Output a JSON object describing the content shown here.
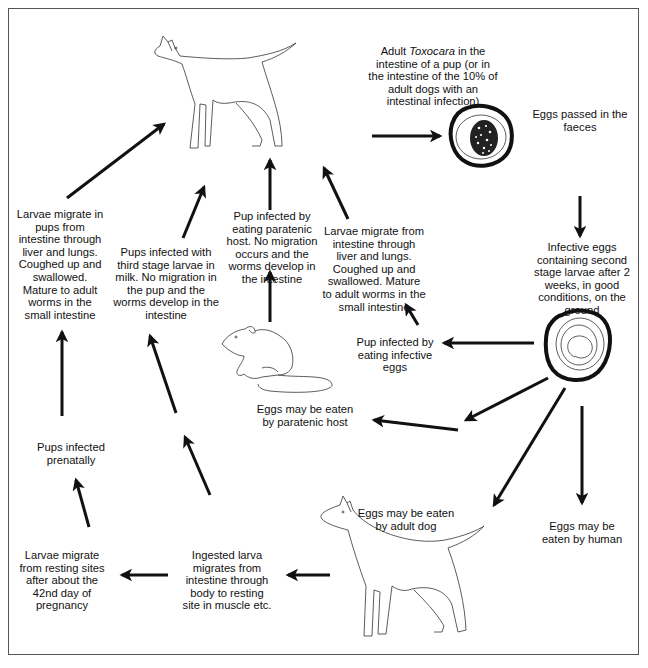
{
  "diagram": {
    "labels": {
      "adult_toxocara": {
        "pre": "Adult ",
        "italic": "Toxocara",
        "post": " in the intestine of a pup (or in the intestine of the 10% of adult dogs with an intestinal infection)"
      },
      "eggs_faeces": "Eggs passed in the faeces",
      "infective_eggs": "Infective eggs containing second stage larvae after 2 weeks, in good conditions, on the ground",
      "pup_infective_eggs": "Pup infected by eating infective eggs",
      "larvae_migrate_center": "Larvae migrate from intestine through liver and lungs. Coughed up and swallowed. Mature to adult worms in the small intestine",
      "pup_paratenic": "Pup infected by eating paratenic host. No migration occurs and the worms develop in the intestine",
      "pups_milk": "Pups infected with third stage larvae in milk. No migration in the pup and the worms develop in the intestine",
      "larvae_migrate_pups": "Larvae migrate in pups from intestine through liver and lungs. Coughed up and swallowed. Mature to adult worms in the small intestine",
      "pups_prenatally": "Pups infected prenatally",
      "larvae_resting": "Larvae migrate from resting sites after about the 42nd day of pregnancy",
      "ingested_larva": "Ingested larva migrates from intestine through body to resting site in muscle etc.",
      "eggs_paratenic": "Eggs may be eaten by paratenic host",
      "eggs_adult_dog": "Eggs may be eaten by adult dog",
      "eggs_human": "Eggs may be eaten by human"
    },
    "illustrations": [
      "pup",
      "adult-dog",
      "rat",
      "egg-with-worms",
      "infective-egg"
    ],
    "colors": {
      "ink": "#111111",
      "frame": "#555555",
      "background": "#ffffff"
    }
  }
}
